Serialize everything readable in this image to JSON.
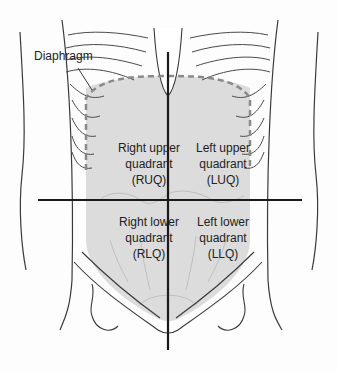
{
  "diagram": {
    "colors": {
      "region_fill": "#dcdcdc",
      "outline": "#3a3a3a",
      "axis_lines": "#1a1a1a",
      "diaphragm_dash": "#8a8a8a"
    },
    "labels": {
      "diaphragm": "Diaphragm",
      "ruq": {
        "line1": "Right upper",
        "line2": "quadrant",
        "line3": "(RUQ)"
      },
      "luq": {
        "line1": "Left upper",
        "line2": "quadrant",
        "line3": "(LUQ)"
      },
      "rlq": {
        "line1": "Right lower",
        "line2": "quadrant",
        "line3": "(RLQ)"
      },
      "llq": {
        "line1": "Left lower",
        "line2": "quadrant",
        "line3": "(LLQ)"
      }
    }
  }
}
